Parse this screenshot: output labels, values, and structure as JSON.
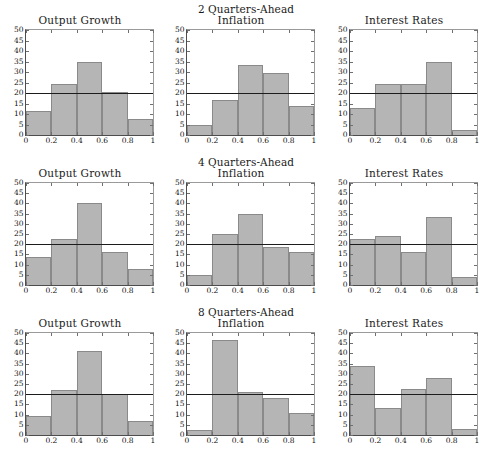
{
  "figure": {
    "width": 492,
    "height": 457,
    "bar_fill": "#b5b5b5",
    "bar_edge": "#8a8a8a",
    "reference_line_color": "#1c1c1c",
    "axis_color": "#4d4d4d"
  },
  "rows": [
    {
      "suptitle": "2 Quarters-Ahead",
      "panels": [
        {
          "title": "Output Growth",
          "chart_data": {
            "type": "bar",
            "title": "Output Growth",
            "xlabel": "",
            "ylabel": "",
            "categories": [
              "0-0.2",
              "0.2-0.4",
              "0.4-0.6",
              "0.6-0.8",
              "0.8-1"
            ],
            "bin_edges": [
              0,
              0.2,
              0.4,
              0.6,
              0.8,
              1
            ],
            "values": [
              11.5,
              24.5,
              35,
              20.5,
              7.5
            ],
            "xlim": [
              0,
              1
            ],
            "ylim": [
              0,
              50
            ],
            "xticks": [
              0,
              0.2,
              0.4,
              0.6,
              0.8,
              1
            ],
            "xticklabels": [
              "0",
              "0.2",
              "0.4",
              "0.6",
              "0.8",
              "1"
            ],
            "yticks": [
              0,
              5,
              10,
              15,
              20,
              25,
              30,
              35,
              40,
              45,
              50
            ],
            "yticklabels": [
              "0",
              "5",
              "10",
              "15",
              "20",
              "25",
              "30",
              "35",
              "40",
              "45",
              "50"
            ],
            "reference_line": 20,
            "grid": false,
            "legend": "none"
          }
        },
        {
          "title": "Inflation",
          "chart_data": {
            "type": "bar",
            "title": "Inflation",
            "xlabel": "",
            "ylabel": "",
            "categories": [
              "0-0.2",
              "0.2-0.4",
              "0.4-0.6",
              "0.6-0.8",
              "0.8-1"
            ],
            "bin_edges": [
              0,
              0.2,
              0.4,
              0.6,
              0.8,
              1
            ],
            "values": [
              5,
              16.5,
              33.5,
              29.5,
              14
            ],
            "xlim": [
              0,
              1
            ],
            "ylim": [
              0,
              50
            ],
            "xticks": [
              0,
              0.2,
              0.4,
              0.6,
              0.8,
              1
            ],
            "xticklabels": [
              "0",
              "0.2",
              "0.4",
              "0.6",
              "0.8",
              "1"
            ],
            "yticks": [
              0,
              5,
              10,
              15,
              20,
              25,
              30,
              35,
              40,
              45,
              50
            ],
            "yticklabels": [
              "0",
              "5",
              "10",
              "15",
              "20",
              "25",
              "30",
              "35",
              "40",
              "45",
              "50"
            ],
            "reference_line": 20,
            "grid": false,
            "legend": "none"
          }
        },
        {
          "title": "Interest Rates",
          "chart_data": {
            "type": "bar",
            "title": "Interest Rates",
            "xlabel": "",
            "ylabel": "",
            "categories": [
              "0-0.2",
              "0.2-0.4",
              "0.4-0.6",
              "0.6-0.8",
              "0.8-1"
            ],
            "bin_edges": [
              0,
              0.2,
              0.4,
              0.6,
              0.8,
              1
            ],
            "values": [
              13,
              24.5,
              24.5,
              35,
              2.5
            ],
            "xlim": [
              0,
              1
            ],
            "ylim": [
              0,
              50
            ],
            "xticks": [
              0,
              0.2,
              0.4,
              0.6,
              0.8,
              1
            ],
            "xticklabels": [
              "0",
              "0.2",
              "0.4",
              "0.6",
              "0.8",
              "1"
            ],
            "yticks": [
              0,
              5,
              10,
              15,
              20,
              25,
              30,
              35,
              40,
              45,
              50
            ],
            "yticklabels": [
              "0",
              "5",
              "10",
              "15",
              "20",
              "25",
              "30",
              "35",
              "40",
              "45",
              "50"
            ],
            "reference_line": 20,
            "grid": false,
            "legend": "none"
          }
        }
      ]
    },
    {
      "suptitle": "4 Quarters-Ahead",
      "panels": [
        {
          "title": "Output Growth",
          "chart_data": {
            "type": "bar",
            "title": "Output Growth",
            "xlabel": "",
            "ylabel": "",
            "categories": [
              "0-0.2",
              "0.2-0.4",
              "0.4-0.6",
              "0.6-0.8",
              "0.8-1"
            ],
            "bin_edges": [
              0,
              0.2,
              0.4,
              0.6,
              0.8,
              1
            ],
            "values": [
              13.5,
              22.5,
              40,
              16,
              8
            ],
            "xlim": [
              0,
              1
            ],
            "ylim": [
              0,
              50
            ],
            "xticks": [
              0,
              0.2,
              0.4,
              0.6,
              0.8,
              1
            ],
            "xticklabels": [
              "0",
              "0.2",
              "0.4",
              "0.6",
              "0.8",
              "1"
            ],
            "yticks": [
              0,
              5,
              10,
              15,
              20,
              25,
              30,
              35,
              40,
              45,
              50
            ],
            "yticklabels": [
              "0",
              "5",
              "10",
              "15",
              "20",
              "25",
              "30",
              "35",
              "40",
              "45",
              "50"
            ],
            "reference_line": 20,
            "grid": false,
            "legend": "none"
          }
        },
        {
          "title": "Inflation",
          "chart_data": {
            "type": "bar",
            "title": "Inflation",
            "xlabel": "",
            "ylabel": "",
            "categories": [
              "0-0.2",
              "0.2-0.4",
              "0.4-0.6",
              "0.6-0.8",
              "0.8-1"
            ],
            "bin_edges": [
              0,
              0.2,
              0.4,
              0.6,
              0.8,
              1
            ],
            "values": [
              5,
              25,
              35,
              18.5,
              16
            ],
            "xlim": [
              0,
              1
            ],
            "ylim": [
              0,
              50
            ],
            "xticks": [
              0,
              0.2,
              0.4,
              0.6,
              0.8,
              1
            ],
            "xticklabels": [
              "0",
              "0.2",
              "0.4",
              "0.6",
              "0.8",
              "1"
            ],
            "yticks": [
              0,
              5,
              10,
              15,
              20,
              25,
              30,
              35,
              40,
              45,
              50
            ],
            "yticklabels": [
              "0",
              "5",
              "10",
              "15",
              "20",
              "25",
              "30",
              "35",
              "40",
              "45",
              "50"
            ],
            "reference_line": 20,
            "grid": false,
            "legend": "none"
          }
        },
        {
          "title": "Interest Rates",
          "chart_data": {
            "type": "bar",
            "title": "Interest Rates",
            "xlabel": "",
            "ylabel": "",
            "categories": [
              "0-0.2",
              "0.2-0.4",
              "0.4-0.6",
              "0.6-0.8",
              "0.8-1"
            ],
            "bin_edges": [
              0,
              0.2,
              0.4,
              0.6,
              0.8,
              1
            ],
            "values": [
              22.5,
              24,
              16,
              33.5,
              4
            ],
            "xlim": [
              0,
              1
            ],
            "ylim": [
              0,
              50
            ],
            "xticks": [
              0,
              0.2,
              0.4,
              0.6,
              0.8,
              1
            ],
            "xticklabels": [
              "0",
              "0.2",
              "0.4",
              "0.6",
              "0.8",
              "1"
            ],
            "yticks": [
              0,
              5,
              10,
              15,
              20,
              25,
              30,
              35,
              40,
              45,
              50
            ],
            "yticklabels": [
              "0",
              "5",
              "10",
              "15",
              "20",
              "25",
              "30",
              "35",
              "40",
              "45",
              "50"
            ],
            "reference_line": 20,
            "grid": false,
            "legend": "none"
          }
        }
      ]
    },
    {
      "suptitle": "8 Quarters-Ahead",
      "panels": [
        {
          "title": "Output Growth",
          "chart_data": {
            "type": "bar",
            "title": "Output Growth",
            "xlabel": "",
            "ylabel": "",
            "categories": [
              "0-0.2",
              "0.2-0.4",
              "0.4-0.6",
              "0.6-0.8",
              "0.8-1"
            ],
            "bin_edges": [
              0,
              0.2,
              0.4,
              0.6,
              0.8,
              1
            ],
            "values": [
              9.5,
              22,
              41,
              20,
              7
            ],
            "xlim": [
              0,
              1
            ],
            "ylim": [
              0,
              50
            ],
            "xticks": [
              0,
              0.2,
              0.4,
              0.6,
              0.8,
              1
            ],
            "xticklabels": [
              "0",
              "0.2",
              "0.4",
              "0.6",
              "0.8",
              "1"
            ],
            "yticks": [
              0,
              5,
              10,
              15,
              20,
              25,
              30,
              35,
              40,
              45,
              50
            ],
            "yticklabels": [
              "0",
              "5",
              "10",
              "15",
              "20",
              "25",
              "30",
              "35",
              "40",
              "45",
              "50"
            ],
            "reference_line": 20,
            "grid": false,
            "legend": "none"
          }
        },
        {
          "title": "Inflation",
          "chart_data": {
            "type": "bar",
            "title": "Inflation",
            "xlabel": "",
            "ylabel": "",
            "categories": [
              "0-0.2",
              "0.2-0.4",
              "0.4-0.6",
              "0.6-0.8",
              "0.8-1"
            ],
            "bin_edges": [
              0,
              0.2,
              0.4,
              0.6,
              0.8,
              1
            ],
            "values": [
              2.5,
              46.5,
              21,
              18,
              11
            ],
            "xlim": [
              0,
              1
            ],
            "ylim": [
              0,
              50
            ],
            "xticks": [
              0,
              0.2,
              0.4,
              0.6,
              0.8,
              1
            ],
            "xticklabels": [
              "0",
              "0.2",
              "0.4",
              "0.6",
              "0.8",
              "1"
            ],
            "yticks": [
              0,
              5,
              10,
              15,
              20,
              25,
              30,
              35,
              40,
              45,
              50
            ],
            "yticklabels": [
              "0",
              "5",
              "10",
              "15",
              "20",
              "25",
              "30",
              "35",
              "40",
              "45",
              "50"
            ],
            "reference_line": 20,
            "grid": false,
            "legend": "none"
          }
        },
        {
          "title": "Interest Rates",
          "chart_data": {
            "type": "bar",
            "title": "Interest Rates",
            "xlabel": "",
            "ylabel": "",
            "categories": [
              "0-0.2",
              "0.2-0.4",
              "0.4-0.6",
              "0.6-0.8",
              "0.8-1"
            ],
            "bin_edges": [
              0,
              0.2,
              0.4,
              0.6,
              0.8,
              1
            ],
            "values": [
              34,
              13,
              22.5,
              28,
              3
            ],
            "xlim": [
              0,
              1
            ],
            "ylim": [
              0,
              50
            ],
            "xticks": [
              0,
              0.2,
              0.4,
              0.6,
              0.8,
              1
            ],
            "xticklabels": [
              "0",
              "0.2",
              "0.4",
              "0.6",
              "0.8",
              "1"
            ],
            "yticks": [
              0,
              5,
              10,
              15,
              20,
              25,
              30,
              35,
              40,
              45,
              50
            ],
            "yticklabels": [
              "0",
              "5",
              "10",
              "15",
              "20",
              "25",
              "30",
              "35",
              "40",
              "45",
              "50"
            ],
            "reference_line": 20,
            "grid": false,
            "legend": "none"
          }
        }
      ]
    }
  ],
  "chart_data": {
    "type": "bar",
    "rows": [
      "2 Quarters-Ahead",
      "4 Quarters-Ahead",
      "8 Quarters-Ahead"
    ],
    "columns": [
      "Output Growth",
      "Inflation",
      "Interest Rates"
    ],
    "categories": [
      "0-0.2",
      "0.2-0.4",
      "0.4-0.6",
      "0.6-0.8",
      "0.8-1"
    ],
    "xlim": [
      0,
      1
    ],
    "ylim": [
      0,
      50
    ],
    "reference_line": 20,
    "grid": false,
    "legend": "none",
    "series": [
      {
        "name": "2 Quarters-Ahead / Output Growth",
        "values": [
          11.5,
          24.5,
          35,
          20.5,
          7.5
        ]
      },
      {
        "name": "2 Quarters-Ahead / Inflation",
        "values": [
          5,
          16.5,
          33.5,
          29.5,
          14
        ]
      },
      {
        "name": "2 Quarters-Ahead / Interest Rates",
        "values": [
          13,
          24.5,
          24.5,
          35,
          2.5
        ]
      },
      {
        "name": "4 Quarters-Ahead / Output Growth",
        "values": [
          13.5,
          22.5,
          40,
          16,
          8
        ]
      },
      {
        "name": "4 Quarters-Ahead / Inflation",
        "values": [
          5,
          25,
          35,
          18.5,
          16
        ]
      },
      {
        "name": "4 Quarters-Ahead / Interest Rates",
        "values": [
          22.5,
          24,
          16,
          33.5,
          4
        ]
      },
      {
        "name": "8 Quarters-Ahead / Output Growth",
        "values": [
          9.5,
          22,
          41,
          20,
          7
        ]
      },
      {
        "name": "8 Quarters-Ahead / Inflation",
        "values": [
          2.5,
          46.5,
          21,
          18,
          11
        ]
      },
      {
        "name": "8 Quarters-Ahead / Interest Rates",
        "values": [
          34,
          13,
          22.5,
          28,
          3
        ]
      }
    ]
  }
}
